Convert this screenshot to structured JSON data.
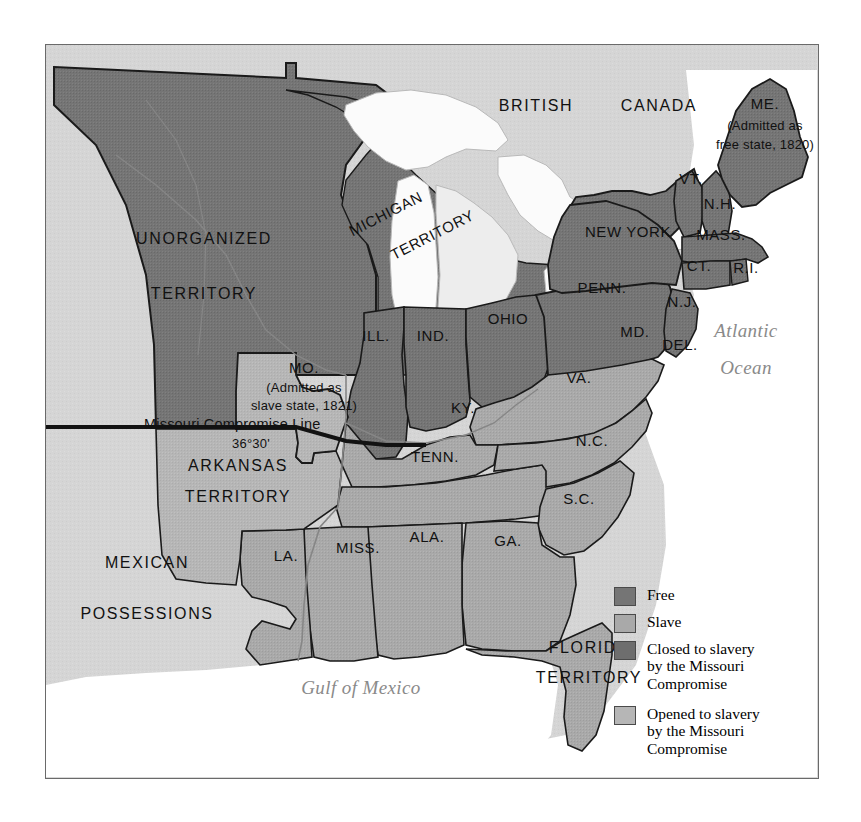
{
  "map": {
    "title": "The Missouri Compromise, 1820",
    "frame": {
      "border_color": "#6a6a6a",
      "background": "#d8d8d8"
    },
    "palette": {
      "free": "#757575",
      "slave": "#a9a9a9",
      "closed_to_slavery": "#6e6e6e",
      "opened_to_slavery": "#b6b6b6",
      "water": "#ffffff",
      "lake": "#f4f4f4",
      "canada": "#cfcfcf",
      "mexico": "#c8c8c8",
      "outline": "#1a1a1a",
      "ocean_label": "#8a8a8a"
    },
    "regions": [
      {
        "name": "UNORGANIZED TERRITORY",
        "label_lines": [
          "UNORGANIZED",
          "TERRITORY"
        ],
        "category": "closed"
      },
      {
        "name": "MICHIGAN TERRITORY",
        "label_lines": [
          "MICHIGAN",
          "TERRITORY"
        ],
        "category": "closed"
      },
      {
        "name": "ARKANSAS TERRITORY",
        "label_lines": [
          "ARKANSAS",
          "TERRITORY"
        ],
        "category": "opened"
      },
      {
        "name": "FLORIDA TERRITORY",
        "label_lines": [
          "FLORIDA",
          "TERRITORY"
        ],
        "category": "slave"
      },
      {
        "name": "BRITISH CANADA",
        "label_lines": [
          "BRITISH",
          "CANADA"
        ],
        "category": "foreign"
      },
      {
        "name": "MEXICAN POSSESSIONS",
        "label_lines": [
          "MEXICAN",
          "POSSESSIONS"
        ],
        "category": "foreign"
      }
    ],
    "state_labels": {
      "maine": "ME.",
      "maine_note_line1": "(Admitted as",
      "maine_note_line2": "free state, 1820)",
      "vermont": "VT.",
      "new_hampshire": "N.H.",
      "massachusetts": "MASS.",
      "connecticut": "CT.",
      "rhode_island": "R.I.",
      "new_york": "NEW YORK",
      "pennsylvania": "PENN.",
      "new_jersey": "N.J.",
      "maryland": "MD.",
      "delaware": "DEL.",
      "ohio": "OHIO",
      "indiana": "IND.",
      "illinois": "ILL.",
      "missouri": "MO.",
      "missouri_note_line1": "(Admitted as",
      "missouri_note_line2": "slave state, 1821)",
      "kentucky": "KY.",
      "virginia": "VA.",
      "tennessee": "TENN.",
      "north_carolina": "N.C.",
      "south_carolina": "S.C.",
      "georgia": "GA.",
      "alabama": "ALA.",
      "mississippi": "MISS.",
      "louisiana": "LA."
    },
    "annotations": {
      "compromise_line": "Missouri Compromise Line",
      "compromise_latitude": "36°30'"
    },
    "water_labels": {
      "atlantic_line1": "Atlantic",
      "atlantic_line2": "Ocean",
      "gulf": "Gulf of Mexico"
    },
    "territory_labels": {
      "unorganized_line1": "UNORGANIZED",
      "unorganized_line2": "TERRITORY",
      "michigan_line1": "MICHIGAN",
      "michigan_line2": "TERRITORY",
      "arkansas_line1": "ARKANSAS",
      "arkansas_line2": "TERRITORY",
      "florida_line1": "FLORIDA",
      "florida_line2": "TERRITORY",
      "canada_line1": "BRITISH",
      "canada_line2": "CANADA",
      "mexico_line1": "MEXICAN",
      "mexico_line2": "POSSESSIONS"
    }
  },
  "legend": {
    "items": [
      {
        "label": "Free",
        "color": "#757575"
      },
      {
        "label": "Slave",
        "color": "#a9a9a9"
      },
      {
        "label": "Closed to slavery\nby the Missouri\nCompromise",
        "color": "#6e6e6e"
      },
      {
        "label": "Opened to slavery\nby the Missouri\nCompromise",
        "color": "#b6b6b6"
      }
    ]
  }
}
